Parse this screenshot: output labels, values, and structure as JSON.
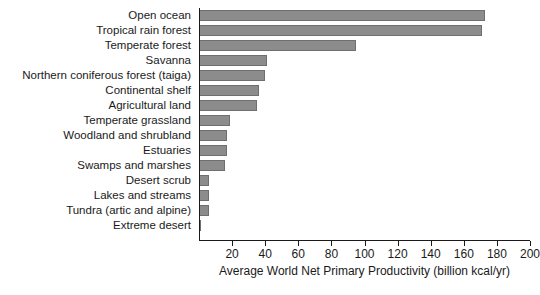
{
  "chart_data": {
    "type": "bar",
    "orientation": "horizontal",
    "title": "",
    "subtitle": "",
    "xlabel": "Average World Net Primary Productivity (billion kcal/yr)",
    "ylabel": "",
    "xlim": [
      0,
      200
    ],
    "xticks": [
      0,
      20,
      40,
      60,
      80,
      100,
      120,
      140,
      160,
      180,
      200
    ],
    "xtick_labels": [
      "",
      "20",
      "40",
      "60",
      "80",
      "100",
      "120",
      "140",
      "160",
      "180",
      "200"
    ],
    "grid": false,
    "legend": null,
    "bar_color": "#8c8c8c",
    "bar_border_color": "#6f6f6f",
    "axis_color": "#1a1a1a",
    "categories": [
      "Open ocean",
      "Tropical rain forest",
      "Temperate forest",
      "Savanna",
      "Northern coniferous forest (taiga)",
      "Continental shelf",
      "Agricultural land",
      "Temperate grassland",
      "Woodland and shrubland",
      "Estuaries",
      "Swamps and marshes",
      "Desert scrub",
      "Lakes and streams",
      "Tundra (artic and alpine)",
      "Extreme desert"
    ],
    "values": [
      173,
      171,
      95,
      41,
      40,
      36,
      35,
      19,
      17,
      17,
      16,
      6,
      6,
      6,
      1
    ]
  }
}
